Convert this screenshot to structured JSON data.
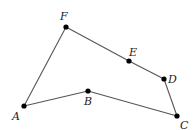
{
  "diagram": {
    "type": "polygon",
    "colors": {
      "edge": "#555555",
      "vertex": "#000000",
      "label": "#222222"
    },
    "vertices": [
      {
        "id": "A",
        "label": "A",
        "x": 24,
        "y": 106,
        "lx": 12,
        "ly": 120
      },
      {
        "id": "B",
        "label": "B",
        "x": 88,
        "y": 91,
        "lx": 84,
        "ly": 105
      },
      {
        "id": "C",
        "label": "C",
        "x": 177,
        "y": 116,
        "lx": 180,
        "ly": 129
      },
      {
        "id": "D",
        "label": "D",
        "x": 164,
        "y": 79,
        "lx": 168,
        "ly": 83
      },
      {
        "id": "E",
        "label": "E",
        "x": 129,
        "y": 61,
        "lx": 129,
        "ly": 56
      },
      {
        "id": "F",
        "label": "F",
        "x": 66,
        "y": 27,
        "lx": 60,
        "ly": 20
      }
    ],
    "edges": [
      [
        "A",
        "B"
      ],
      [
        "B",
        "C"
      ],
      [
        "C",
        "D"
      ],
      [
        "D",
        "E"
      ],
      [
        "E",
        "F"
      ],
      [
        "F",
        "A"
      ]
    ]
  }
}
